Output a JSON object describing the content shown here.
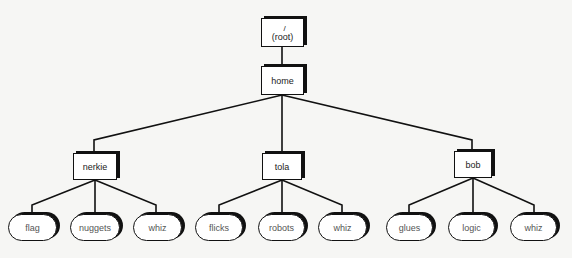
{
  "diagram": {
    "type": "directory-tree",
    "colors": {
      "line": "#111111",
      "node_fill": "#ffffff",
      "background": "#f6f6f4",
      "leaf_text": "#555555"
    },
    "root": {
      "slash": "/",
      "label": "(root)"
    },
    "home": {
      "label": "home"
    },
    "users": [
      {
        "label": "nerkie",
        "children": [
          "flag",
          "nuggets",
          "whiz"
        ]
      },
      {
        "label": "tola",
        "children": [
          "flicks",
          "robots",
          "whiz"
        ]
      },
      {
        "label": "bob",
        "children": [
          "glues",
          "logic",
          "whiz"
        ]
      }
    ]
  }
}
